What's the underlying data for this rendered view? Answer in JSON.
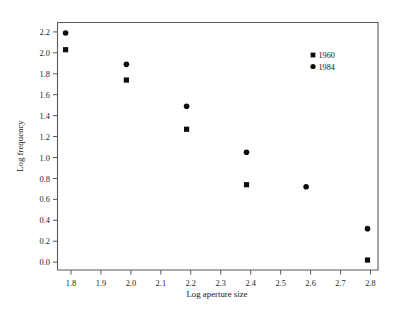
{
  "chart_data": {
    "type": "scatter",
    "title": "",
    "xlabel": "Log aperture size",
    "ylabel": "Log frequency",
    "xlim": [
      1.755,
      2.825
    ],
    "ylim": [
      -0.075,
      2.29
    ],
    "xticks": [
      "1.8",
      "1.9",
      "2.0",
      "2.1",
      "2.2",
      "2.3",
      "2.4",
      "2.5",
      "2.6",
      "2.7",
      "2.8"
    ],
    "xtick_values": [
      1.8,
      1.9,
      2.0,
      2.1,
      2.2,
      2.3,
      2.4,
      2.5,
      2.6,
      2.7,
      2.8
    ],
    "yticks": [
      "0.0",
      "0.2",
      "0.4",
      "0.6",
      "0.8",
      "1.0",
      "1.2",
      "1.4",
      "1.6",
      "1.8",
      "2.0",
      "2.2"
    ],
    "ytick_values": [
      0.0,
      0.2,
      0.4,
      0.6,
      0.8,
      1.0,
      1.2,
      1.4,
      1.6,
      1.8,
      2.0,
      2.2
    ],
    "grid": false,
    "legend_position": "top-right-inside",
    "series": [
      {
        "name": "1960",
        "marker": "square",
        "color": "#0d0d0d",
        "points": [
          {
            "x": 1.782,
            "y": 2.03
          },
          {
            "x": 1.985,
            "y": 1.74
          },
          {
            "x": 2.186,
            "y": 1.27
          },
          {
            "x": 2.386,
            "y": 0.74
          },
          {
            "x": 2.79,
            "y": 0.02
          }
        ]
      },
      {
        "name": "1984",
        "marker": "circle",
        "color": "#0d0d0d",
        "points": [
          {
            "x": 1.782,
            "y": 2.19
          },
          {
            "x": 1.985,
            "y": 1.89
          },
          {
            "x": 2.186,
            "y": 1.49
          },
          {
            "x": 2.386,
            "y": 1.05
          },
          {
            "x": 2.585,
            "y": 0.72
          },
          {
            "x": 2.79,
            "y": 0.32
          }
        ]
      }
    ]
  },
  "legend": {
    "entries": [
      {
        "label": "1960",
        "marker": "square"
      },
      {
        "label": "1984",
        "marker": "circle"
      }
    ]
  }
}
